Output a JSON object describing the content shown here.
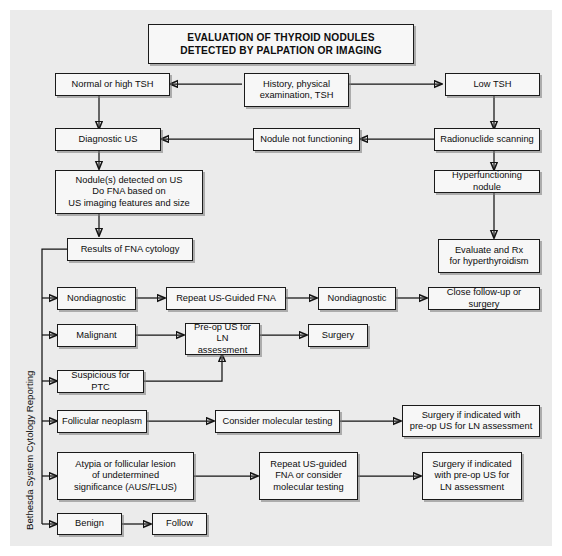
{
  "figure": {
    "title": "EVALUATION OF THYROID NODULES\nDETECTED BY PALPATION OR IMAGING",
    "side_label": "Bethesda System Cytology Reporting",
    "background_color": "#ebebeb",
    "box_fill_color": "#f7f7f7",
    "line_color": "#141414"
  },
  "nodes": {
    "history": "History, physical\nexamination, TSH",
    "normal_high_tsh": "Normal or high TSH",
    "low_tsh": "Low TSH",
    "diagnostic_us": "Diagnostic US",
    "nodule_not_functioning": "Nodule not functioning",
    "radionuclide_scanning": "Radionuclide scanning",
    "nodules_detected": "Nodule(s) detected on US\nDo FNA based on\nUS imaging features and size",
    "hyperfunctioning_nodule": "Hyperfunctioning nodule",
    "results_fna": "Results of FNA cytology",
    "evaluate_rx": "Evaluate and Rx\nfor hyperthyroidism",
    "nondiagnostic_1": "Nondiagnostic",
    "repeat_us_fna": "Repeat US-Guided FNA",
    "nondiagnostic_2": "Nondiagnostic",
    "close_followup": "Close follow-up or surgery",
    "malignant": "Malignant",
    "preop_us_ln": "Pre-op US for LN\nassessment",
    "surgery": "Surgery",
    "suspicious_ptc": "Suspicious for PTC",
    "follicular_neoplasm": "Follicular neoplasm",
    "consider_molecular": "Consider molecular testing",
    "surgery_indicated_1": "Surgery if indicated with\npre-op US for LN assessment",
    "aus_flus": "Atypia or follicular lesion\nof undetermined\nsignificance (AUS/FLUS)",
    "repeat_us_or_molecular": "Repeat US-guided\nFNA or consider\nmolecular testing",
    "surgery_indicated_2": "Surgery if indicated\nwith pre-op US for\nLN assessment",
    "benign": "Benign",
    "follow": "Follow"
  }
}
